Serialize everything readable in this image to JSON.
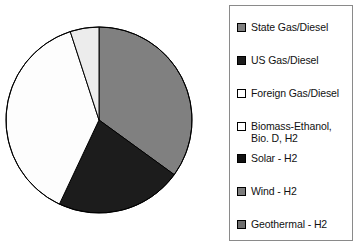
{
  "chart_data": {
    "type": "pie",
    "title": "",
    "legend_position": "right",
    "start_angle_deg": 0,
    "direction": "clockwise",
    "categories": [
      "State Gas/Diesel",
      "US Gas/Diesel",
      "Foreign Gas/Diesel",
      "Biomass-Ethanol, Bio. D, H2",
      "Solar - H2",
      "Wind - H2",
      "Geothermal - H2"
    ],
    "values": [
      35,
      22,
      38,
      5,
      0,
      0,
      0
    ],
    "slice_colors": [
      "#808080",
      "#1c1c1c",
      "#fdfdfd",
      "#ececec",
      "#1c1c1c",
      "#808080",
      "#6e6e6e"
    ],
    "visible_slices": [
      {
        "label": "State Gas/Diesel",
        "percent": 35,
        "color": "#808080"
      },
      {
        "label": "US Gas/Diesel",
        "percent": 22,
        "color": "#1c1c1c"
      },
      {
        "label": "Foreign Gas/Diesel",
        "percent": 38,
        "color": "#fdfdfd"
      },
      {
        "label": "Biomass-Ethanol, Bio. D, H2",
        "percent": 5,
        "color": "#ececec"
      }
    ],
    "xlabel": "",
    "ylabel": ""
  },
  "pie": {
    "center_x": 99,
    "center_y": 120,
    "radius": 93,
    "outline_color": "#000000"
  },
  "legend": {
    "border_color": "#8a8a8a",
    "items": [
      {
        "label": "State Gas/Diesel",
        "swatch": "#808080",
        "top": 15,
        "icon": "legend-swatch-icon"
      },
      {
        "label": "US Gas/Diesel",
        "swatch": "#1c1c1c",
        "top": 48,
        "icon": "legend-swatch-icon"
      },
      {
        "label": "Foreign Gas/Diesel",
        "swatch": "#ffffff",
        "top": 81,
        "icon": "legend-swatch-icon"
      },
      {
        "label": "Biomass-Ethanol,\n  Bio. D, H2",
        "swatch": "#ffffff",
        "top": 114,
        "icon": "legend-swatch-icon"
      },
      {
        "label": "Solar - H2",
        "swatch": "#111111",
        "top": 146,
        "icon": "legend-swatch-icon"
      },
      {
        "label": "Wind - H2",
        "swatch": "#7d7d7d",
        "top": 179,
        "icon": "legend-swatch-icon"
      },
      {
        "label": "Geothermal - H2",
        "swatch": "#6e6e6e",
        "top": 212,
        "icon": "legend-swatch-icon"
      }
    ]
  }
}
